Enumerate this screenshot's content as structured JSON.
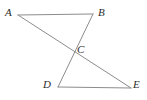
{
  "figure": {
    "background_color": "#ffffff",
    "stroke_color": "#8c8c8c",
    "label_color": "#2b2b2b",
    "stroke_width": 1,
    "width": 147,
    "height": 100
  },
  "points": {
    "A": {
      "label": "A",
      "x": 18,
      "y": 15,
      "label_x": 5,
      "label_y": 7
    },
    "B": {
      "label": "B",
      "x": 93,
      "y": 14,
      "label_x": 98,
      "label_y": 7
    },
    "C": {
      "label": "C",
      "x": 73,
      "y": 50,
      "label_x": 77,
      "label_y": 44
    },
    "D": {
      "label": "D",
      "x": 58,
      "y": 87,
      "label_x": 43,
      "label_y": 79
    },
    "E": {
      "label": "E",
      "x": 131,
      "y": 88,
      "label_x": 133,
      "label_y": 79
    }
  },
  "segments": [
    {
      "name": "segment-ab",
      "from": "A",
      "to": "B",
      "path": "M 18 15 L 93 14"
    },
    {
      "name": "segment-ae",
      "from": "A",
      "to": "E",
      "path": "M 18 15 L 131 88"
    },
    {
      "name": "segment-bd",
      "from": "B",
      "to": "D",
      "path": "M 93 14 L 58 87"
    },
    {
      "name": "segment-de",
      "from": "D",
      "to": "E",
      "path": "M 58 87 L 131 88"
    }
  ],
  "chart_data": {
    "type": "diagram",
    "vertices": [
      {
        "name": "A",
        "x": 18,
        "y": 15
      },
      {
        "name": "B",
        "x": 93,
        "y": 14
      },
      {
        "name": "C",
        "x": 73,
        "y": 50
      },
      {
        "name": "D",
        "x": 58,
        "y": 87
      },
      {
        "name": "E",
        "x": 131,
        "y": 88
      }
    ],
    "edges": [
      {
        "from": "A",
        "to": "B"
      },
      {
        "from": "A",
        "to": "E"
      },
      {
        "from": "B",
        "to": "D"
      },
      {
        "from": "D",
        "to": "E"
      }
    ],
    "intersections": [
      {
        "point": "C",
        "of": [
          "A-E",
          "B-D"
        ],
        "x": 73,
        "y": 50
      }
    ]
  }
}
